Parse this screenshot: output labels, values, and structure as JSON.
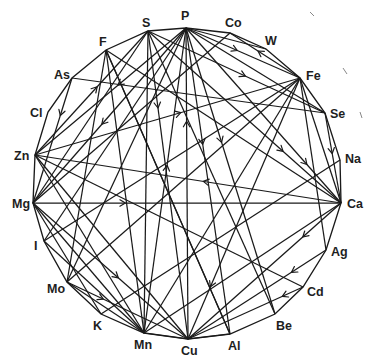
{
  "diagram": {
    "type": "circular-network",
    "nodes": [
      {
        "id": "P",
        "label": "P",
        "x": 186,
        "y": 28,
        "lx": 181,
        "ly": 20,
        "anchor": "start"
      },
      {
        "id": "Co",
        "label": "Co",
        "x": 230,
        "y": 33,
        "lx": 225,
        "ly": 27,
        "anchor": "start"
      },
      {
        "id": "W",
        "label": "W",
        "x": 266,
        "y": 49,
        "lx": 265,
        "ly": 45,
        "anchor": "start"
      },
      {
        "id": "Fe",
        "label": "Fe",
        "x": 300,
        "y": 78,
        "lx": 306,
        "ly": 80,
        "anchor": "start"
      },
      {
        "id": "Se",
        "label": "Se",
        "x": 325,
        "y": 113,
        "lx": 330,
        "ly": 118,
        "anchor": "start"
      },
      {
        "id": "Na",
        "label": "Na",
        "x": 340,
        "y": 160,
        "lx": 345,
        "ly": 163,
        "anchor": "start"
      },
      {
        "id": "Ca",
        "label": "Ca",
        "x": 341,
        "y": 203,
        "lx": 347,
        "ly": 208,
        "anchor": "start"
      },
      {
        "id": "Ag",
        "label": "Ag",
        "x": 326,
        "y": 250,
        "lx": 331,
        "ly": 256,
        "anchor": "start"
      },
      {
        "id": "Cd",
        "label": "Cd",
        "x": 303,
        "y": 287,
        "lx": 307,
        "ly": 296,
        "anchor": "start"
      },
      {
        "id": "Be",
        "label": "Be",
        "x": 275,
        "y": 314,
        "lx": 276,
        "ly": 330,
        "anchor": "start"
      },
      {
        "id": "Al",
        "label": "Al",
        "x": 230,
        "y": 334,
        "lx": 228,
        "ly": 350,
        "anchor": "start"
      },
      {
        "id": "Cu",
        "label": "Cu",
        "x": 188,
        "y": 339,
        "lx": 181,
        "ly": 355,
        "anchor": "start"
      },
      {
        "id": "Mn",
        "label": "Mn",
        "x": 144,
        "y": 333,
        "lx": 134,
        "ly": 349,
        "anchor": "start"
      },
      {
        "id": "K",
        "label": "K",
        "x": 101,
        "y": 314,
        "lx": 93,
        "ly": 330,
        "anchor": "start"
      },
      {
        "id": "Mo",
        "label": "Mo",
        "x": 67,
        "y": 282,
        "lx": 47,
        "ly": 293,
        "anchor": "start"
      },
      {
        "id": "I",
        "label": "I",
        "x": 44,
        "y": 241,
        "lx": 34,
        "ly": 250,
        "anchor": "start"
      },
      {
        "id": "Mg",
        "label": "Mg",
        "x": 33,
        "y": 203,
        "lx": 12,
        "ly": 208,
        "anchor": "start"
      },
      {
        "id": "Zn",
        "label": "Zn",
        "x": 35,
        "y": 155,
        "lx": 14,
        "ly": 160,
        "anchor": "start"
      },
      {
        "id": "Cl",
        "label": "Cl",
        "x": 48,
        "y": 112,
        "lx": 30,
        "ly": 117,
        "anchor": "start"
      },
      {
        "id": "As",
        "label": "As",
        "x": 72,
        "y": 78,
        "lx": 54,
        "ly": 79,
        "anchor": "start"
      },
      {
        "id": "F",
        "label": "F",
        "x": 106,
        "y": 50,
        "lx": 99,
        "ly": 46,
        "anchor": "start"
      },
      {
        "id": "S",
        "label": "S",
        "x": 148,
        "y": 31,
        "lx": 142,
        "ly": 27,
        "anchor": "start"
      }
    ],
    "edges": [
      {
        "from": "P",
        "to": "Zn",
        "arrow": 0.45,
        "dir": 1
      },
      {
        "from": "P",
        "to": "Mg",
        "arrow": 0.55,
        "dir": 1
      },
      {
        "from": "P",
        "to": "I",
        "arrow": 0.0,
        "dir": 0
      },
      {
        "from": "P",
        "to": "Mo",
        "arrow": 0.0,
        "dir": 0
      },
      {
        "from": "P",
        "to": "Mn",
        "arrow": 0.45,
        "dir": -1
      },
      {
        "from": "P",
        "to": "Cu",
        "arrow": 0.3,
        "dir": -1
      },
      {
        "from": "P",
        "to": "Al",
        "arrow": 0.38,
        "dir": 1
      },
      {
        "from": "P",
        "to": "Be",
        "arrow": 0.4,
        "dir": 1
      },
      {
        "from": "P",
        "to": "Ca",
        "arrow": 0.78,
        "dir": 1
      },
      {
        "from": "P",
        "to": "Fe",
        "arrow": 0.45,
        "dir": 1
      },
      {
        "from": "P",
        "to": "Se",
        "arrow": 0.0,
        "dir": 0
      },
      {
        "from": "P",
        "to": "W",
        "arrow": 0.0,
        "dir": 0
      },
      {
        "from": "S",
        "to": "Zn",
        "arrow": 0.45,
        "dir": -1
      },
      {
        "from": "S",
        "to": "Mg",
        "arrow": 0.0,
        "dir": 0
      },
      {
        "from": "S",
        "to": "Cu",
        "arrow": 0.25,
        "dir": 1
      },
      {
        "from": "S",
        "to": "Ca",
        "arrow": 0.7,
        "dir": 1
      },
      {
        "from": "S",
        "to": "Se",
        "arrow": 0.55,
        "dir": 1
      },
      {
        "from": "S",
        "to": "Mn",
        "arrow": 0.0,
        "dir": 0
      },
      {
        "from": "F",
        "to": "Mn",
        "arrow": 0.0,
        "dir": 0
      },
      {
        "from": "F",
        "to": "Ca",
        "arrow": 0.0,
        "dir": 0
      },
      {
        "from": "F",
        "to": "Mo",
        "arrow": 0.0,
        "dir": 0
      },
      {
        "from": "F",
        "to": "Al",
        "arrow": 0.0,
        "dir": 0
      },
      {
        "from": "As",
        "to": "Se",
        "arrow": 0.0,
        "dir": 0
      },
      {
        "from": "As",
        "to": "Mg",
        "arrow": 0.3,
        "dir": 1
      },
      {
        "from": "Co",
        "to": "Mg",
        "arrow": 0.0,
        "dir": 0
      },
      {
        "from": "Co",
        "to": "Fe",
        "arrow": 0.4,
        "dir": -1
      },
      {
        "from": "Fe",
        "to": "Zn",
        "arrow": 0.45,
        "dir": -1
      },
      {
        "from": "Fe",
        "to": "Cu",
        "arrow": 0.8,
        "dir": 1
      },
      {
        "from": "Fe",
        "to": "Mn",
        "arrow": 0.0,
        "dir": 0
      },
      {
        "from": "Fe",
        "to": "Ca",
        "arrow": 0.0,
        "dir": 0
      },
      {
        "from": "Fe",
        "to": "Ag",
        "arrow": 0.0,
        "dir": 0
      },
      {
        "from": "Se",
        "to": "Ca",
        "arrow": 0.45,
        "dir": 1
      },
      {
        "from": "Zn",
        "to": "Ca",
        "arrow": 0.55,
        "dir": -1
      },
      {
        "from": "Zn",
        "to": "Cu",
        "arrow": 0.0,
        "dir": 0
      },
      {
        "from": "Zn",
        "to": "Mn",
        "arrow": 0.0,
        "dir": 0
      },
      {
        "from": "Mg",
        "to": "Ca",
        "arrow": 0.3,
        "dir": 1
      },
      {
        "from": "Mg",
        "to": "Cu",
        "arrow": 0.55,
        "dir": 1
      },
      {
        "from": "Mg",
        "to": "K",
        "arrow": 0.0,
        "dir": 0
      },
      {
        "from": "Mg",
        "to": "Mn",
        "arrow": 0.0,
        "dir": 0
      },
      {
        "from": "I",
        "to": "Fe",
        "arrow": 0.0,
        "dir": 0
      },
      {
        "from": "I",
        "to": "Mn",
        "arrow": 0.0,
        "dir": 0
      },
      {
        "from": "Mo",
        "to": "Cu",
        "arrow": 0.3,
        "dir": 1
      },
      {
        "from": "Mo",
        "to": "Fe",
        "arrow": 0.0,
        "dir": 0
      },
      {
        "from": "Mo",
        "to": "Mn",
        "arrow": 0.0,
        "dir": 0
      },
      {
        "from": "K",
        "to": "Na",
        "arrow": 0.0,
        "dir": 0
      },
      {
        "from": "Ca",
        "to": "Cu",
        "arrow": 0.25,
        "dir": 1
      },
      {
        "from": "Ca",
        "to": "Mn",
        "arrow": 0.0,
        "dir": 0
      },
      {
        "from": "Ag",
        "to": "Cu",
        "arrow": 0.25,
        "dir": 1
      },
      {
        "from": "Cd",
        "to": "Cu",
        "arrow": 0.18,
        "dir": 1
      },
      {
        "from": "Cd",
        "to": "Zn",
        "arrow": 0.0,
        "dir": 0
      },
      {
        "from": "Be",
        "to": "S",
        "arrow": 0.0,
        "dir": 0
      },
      {
        "from": "Al",
        "to": "F",
        "arrow": 0.0,
        "dir": 0
      },
      {
        "from": "Al",
        "to": "Cu",
        "arrow": 0.0,
        "dir": 0
      },
      {
        "from": "Cu",
        "to": "Mn",
        "arrow": 0.0,
        "dir": 0
      }
    ],
    "style": {
      "line_color": "#1a1a1a",
      "label_color": "#1e1e1e",
      "background": "#ffffff"
    }
  }
}
